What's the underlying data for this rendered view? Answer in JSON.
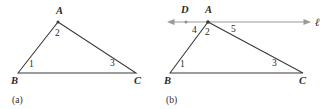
{
  "figure": {
    "background_color": "#ffffff",
    "line_color": "#3a3a3a",
    "ray_color": "#9a9a9a",
    "panels": [
      {
        "id": "a",
        "caption": "(a)",
        "vertices": {
          "A": {
            "label": "A",
            "x": 58,
            "y": 22
          },
          "B": {
            "label": "B",
            "x": 18,
            "y": 73
          },
          "C": {
            "label": "C",
            "x": 136,
            "y": 73
          }
        },
        "vertex_label_positions": {
          "A": {
            "x": 56,
            "y": 14
          },
          "B": {
            "x": 11,
            "y": 84
          },
          "C": {
            "x": 134,
            "y": 84
          }
        },
        "angle_labels": [
          {
            "name": "1",
            "x": 29,
            "y": 67
          },
          {
            "name": "2",
            "x": 55,
            "y": 36
          },
          {
            "name": "3",
            "x": 110,
            "y": 66
          }
        ]
      },
      {
        "id": "b",
        "caption": "(b)",
        "vertices": {
          "A": {
            "label": "A",
            "x": 208,
            "y": 22
          },
          "B": {
            "label": "B",
            "x": 170,
            "y": 73
          },
          "C": {
            "label": "C",
            "x": 303,
            "y": 73
          },
          "D": {
            "label": "D",
            "x": 186,
            "y": 22
          }
        },
        "vertex_label_positions": {
          "A": {
            "x": 205,
            "y": 13
          },
          "B": {
            "x": 164,
            "y": 84
          },
          "C": {
            "x": 299,
            "y": 84
          },
          "D": {
            "x": 182,
            "y": 13
          }
        },
        "line": {
          "label": "ℓ",
          "label_x": 317,
          "label_y": 26,
          "y": 22,
          "x_start": 168,
          "x_end": 310,
          "arrows": "both"
        },
        "angle_labels": [
          {
            "name": "1",
            "x": 180,
            "y": 67
          },
          {
            "name": "2",
            "x": 205,
            "y": 35
          },
          {
            "name": "3",
            "x": 272,
            "y": 66
          },
          {
            "name": "4",
            "x": 192,
            "y": 33
          },
          {
            "name": "5",
            "x": 231,
            "y": 32
          }
        ]
      }
    ]
  }
}
